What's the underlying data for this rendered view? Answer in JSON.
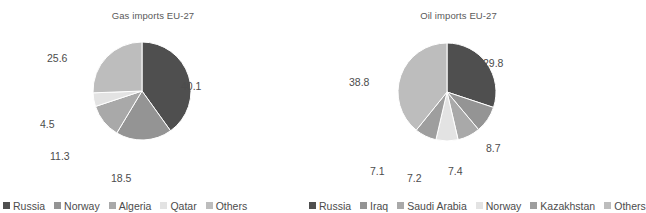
{
  "chart_data": [
    {
      "type": "pie",
      "title": "Gas imports EU-27",
      "xlabel": "",
      "ylabel": "",
      "legend_position": "bottom",
      "grid": false,
      "start_angle_deg": 0,
      "direction": "clockwise",
      "categories": [
        "Russia",
        "Norway",
        "Algeria",
        "Qatar",
        "Others"
      ],
      "values": [
        40.1,
        18.5,
        11.3,
        4.5,
        25.6
      ],
      "labels": [
        "40.1",
        "18.5",
        "11.3",
        "4.5",
        "25.6"
      ],
      "colors": [
        "#4f4f4f",
        "#949494",
        "#a9a9a9",
        "#e3e3e3",
        "#bdbdbd"
      ]
    },
    {
      "type": "pie",
      "title": "Oil imports EU-27",
      "xlabel": "",
      "ylabel": "",
      "legend_position": "bottom",
      "grid": false,
      "start_angle_deg": 0,
      "direction": "clockwise",
      "categories": [
        "Russia",
        "Iraq",
        "Saudi Arabia",
        "Norway",
        "Kazakhstan",
        "Others"
      ],
      "values": [
        29.8,
        8.7,
        7.4,
        7.2,
        7.1,
        38.8
      ],
      "labels": [
        "29.8",
        "8.7",
        "7.4",
        "7.2",
        "7.1",
        "38.8"
      ],
      "colors": [
        "#4f4f4f",
        "#949494",
        "#a9a9a9",
        "#e3e3e3",
        "#9e9e9e",
        "#bdbdbd"
      ]
    }
  ],
  "figure": {
    "background": "#ffffff",
    "text_color": "#4c4c4c",
    "title_color": "#595959"
  },
  "gas": {
    "title": "Gas imports EU-27",
    "legend": [
      {
        "label": "Russia",
        "color": "#4f4f4f"
      },
      {
        "label": "Norway",
        "color": "#949494"
      },
      {
        "label": "Algeria",
        "color": "#a9a9a9"
      },
      {
        "label": "Qatar",
        "color": "#e3e3e3"
      },
      {
        "label": "Others",
        "color": "#bdbdbd"
      }
    ],
    "labels": {
      "russia": "40.1",
      "norway": "18.5",
      "algeria": "11.3",
      "qatar": "4.5",
      "others": "25.6"
    }
  },
  "oil": {
    "title": "Oil imports EU-27",
    "legend": [
      {
        "label": "Russia",
        "color": "#4f4f4f"
      },
      {
        "label": "Iraq",
        "color": "#949494"
      },
      {
        "label": "Saudi Arabia",
        "color": "#a9a9a9"
      },
      {
        "label": "Norway",
        "color": "#e3e3e3"
      },
      {
        "label": "Kazakhstan",
        "color": "#9e9e9e"
      },
      {
        "label": "Others",
        "color": "#bdbdbd"
      }
    ],
    "labels": {
      "russia": "29.8",
      "iraq": "8.7",
      "saudi_arabia": "7.4",
      "norway": "7.2",
      "kazakhstan": "7.1",
      "others": "38.8"
    }
  }
}
